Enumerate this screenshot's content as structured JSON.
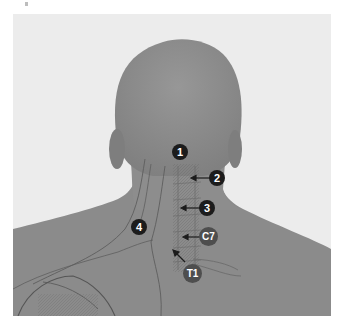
{
  "figure": {
    "colors": {
      "background": "#ececec",
      "skin": "#8a8a8a",
      "skin_light": "#9a9a9a",
      "outline": "#5a5a5a",
      "number_marker": "#1c1c1c",
      "vertebra_marker": "#4e4e4e"
    },
    "markers": [
      {
        "id": "1",
        "label": "1",
        "kind": "number"
      },
      {
        "id": "2",
        "label": "2",
        "kind": "number",
        "arrow": "left"
      },
      {
        "id": "3",
        "label": "3",
        "kind": "number",
        "arrow": "left"
      },
      {
        "id": "4",
        "label": "4",
        "kind": "number"
      },
      {
        "id": "c7",
        "label": "C7",
        "kind": "vertebra",
        "arrow": "left"
      },
      {
        "id": "t1",
        "label": "T1",
        "kind": "vertebra",
        "arrow": "up-left"
      }
    ]
  }
}
